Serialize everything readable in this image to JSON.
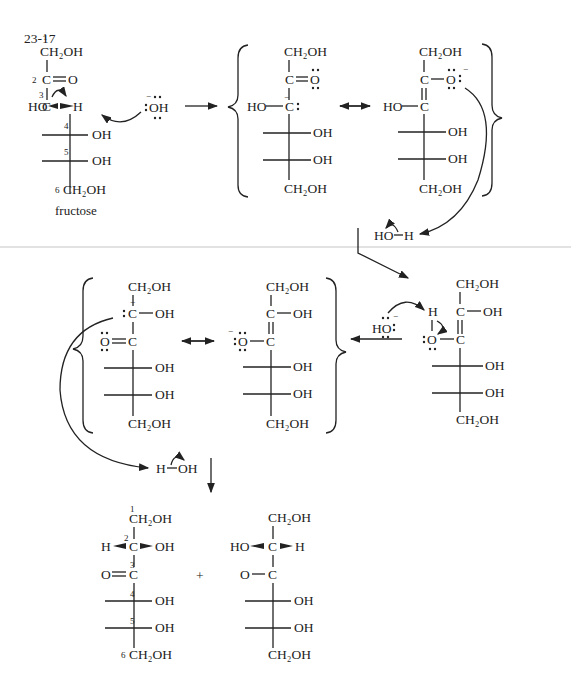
{
  "problem_number": "23-17",
  "reactant": {
    "name": "fructose",
    "c1": "CH₂OH",
    "c1_num": "1",
    "c2": "C",
    "c2_o": "O",
    "c2_num": "2",
    "c3": "C",
    "c3_num": "3",
    "c3_left": "HO",
    "c3_right": "H",
    "c4_num": "4",
    "c4_right": "OH",
    "c5_num": "5",
    "c5_right": "OH",
    "c6": "CH₂OH",
    "c6_num": "6"
  },
  "base": {
    "label": "OH",
    "charge": "−"
  },
  "enolate_a": {
    "c1": "CH₂OH",
    "c2": "C",
    "c2_o": "O",
    "c3": "C",
    "c3_left": "HO",
    "charge": "−",
    "c4_right": "OH",
    "c5_right": "OH",
    "c6": "CH₂OH"
  },
  "enolate_b": {
    "c1": "CH₂OH",
    "c2": "C",
    "c2_o": "O",
    "c3": "C",
    "c3_left": "HO",
    "charge": "−",
    "c4_right": "OH",
    "c5_right": "OH",
    "c6": "CH₂OH"
  },
  "water_1": {
    "left": "HO",
    "right": "H"
  },
  "enediol": {
    "c1": "CH₂OH",
    "c2": "C",
    "c2_right": "OH",
    "c3": "C",
    "o": "O",
    "h": "H",
    "c4_right": "OH",
    "c5_right": "OH",
    "c6": "CH₂OH"
  },
  "hydroxide_2": {
    "label": "HO",
    "charge": "−"
  },
  "enolate_c": {
    "c1": "CH₂OH",
    "c2": "C",
    "c2_right": "OH",
    "charge": "−",
    "o": "O",
    "c3": "C",
    "c4_right": "OH",
    "c5_right": "OH",
    "c6": "CH₂OH"
  },
  "enolate_d": {
    "c1": "CH₂OH",
    "c2": "C",
    "c2_right": "OH",
    "o": "O",
    "charge": "−",
    "c3": "C",
    "c4_right": "OH",
    "c5_right": "OH",
    "c6": "CH₂OH"
  },
  "water_2": {
    "left": "H",
    "right": "OH"
  },
  "product_1": {
    "c1": "CH₂OH",
    "c1_num": "1",
    "c2": "C",
    "c2_num": "2",
    "c2_left": "H",
    "c2_right": "OH",
    "c3": "C",
    "c3_num": "3",
    "c3_o": "O",
    "c4_num": "4",
    "c4_right": "OH",
    "c5_num": "5",
    "c5_right": "OH",
    "c6": "CH₂OH",
    "c6_num": "6"
  },
  "plus": "+",
  "product_2": {
    "c1": "CH₂OH",
    "c2": "C",
    "c2_left": "HO",
    "c2_right": "H",
    "c3": "C",
    "c3_o": "O",
    "c4_right": "OH",
    "c5_right": "OH",
    "c6": "CH₂OH"
  }
}
